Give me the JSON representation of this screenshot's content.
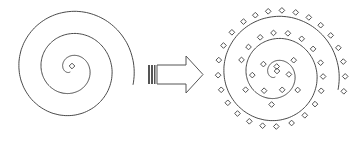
{
  "diagram": {
    "colors": {
      "stroke": "#4a4a4a",
      "background": "#ffffff"
    },
    "left_spiral": {
      "center": [
        71,
        69
      ],
      "turns": 2.75,
      "center_marker": "diamond"
    },
    "arrow": {
      "direction": "right",
      "style": "hollow block arrow with striped tail"
    },
    "right_spiral": {
      "center": [
        276,
        74
      ],
      "turns": 2.75,
      "marker": "diamond",
      "marker_count_approx": 60
    }
  }
}
